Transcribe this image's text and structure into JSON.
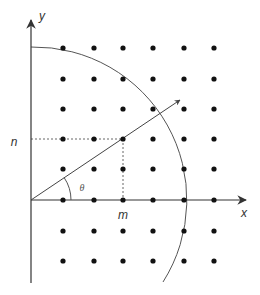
{
  "diagram": {
    "width": 260,
    "height": 295,
    "origin": [
      31,
      200
    ],
    "colors": {
      "background": "#ffffff",
      "axis": "#333333",
      "dot": "#111111",
      "arc": "#555555",
      "vector": "#444444",
      "dotted": "#666666"
    },
    "grid": {
      "columns_x": [
        63,
        94,
        123,
        153,
        184,
        214
      ],
      "rows_y": [
        48,
        79,
        109,
        139,
        169,
        200,
        231,
        261
      ],
      "dot_radius": 2.6
    },
    "axes": {
      "x_axis": {
        "from": [
          31,
          200
        ],
        "to": [
          246,
          200
        ]
      },
      "y_axis": {
        "from": [
          31,
          283
        ],
        "to": [
          31,
          20
        ]
      }
    },
    "circle_arc": {
      "center": [
        31,
        200
      ],
      "radius": 153,
      "start": [
        31,
        47
      ],
      "end": [
        163,
        282
      ]
    },
    "vector": {
      "from": [
        31,
        200
      ],
      "to": [
        180,
        100
      ]
    },
    "projection": {
      "point": [
        123,
        139
      ]
    },
    "angle_arc": {
      "radius": 40
    }
  },
  "labels": {
    "x_axis": "x",
    "y_axis": "y",
    "n": "n",
    "m": "m",
    "theta": "θ"
  },
  "label_positions": {
    "x_axis": [
      244,
      213
    ],
    "y_axis": [
      42,
      16
    ],
    "n": [
      14,
      142
    ],
    "m": [
      123,
      215
    ],
    "theta": [
      82,
      188
    ]
  }
}
